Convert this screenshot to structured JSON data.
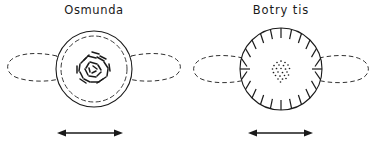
{
  "figure": {
    "background_color": "#ffffff",
    "ink_color": "#1a1a1a",
    "width": 375,
    "height": 142,
    "panel_count": 2
  },
  "panels": [
    {
      "key": "osmunda",
      "label": "Osmunda",
      "center_x": 94,
      "center_y": 69,
      "outline_style": "double-circle",
      "outer_circle_radius": 38,
      "inner_circle_radius": 33,
      "inner_circle_dash": "dashed",
      "center_pattern": "short-dash-rosette",
      "center_pattern_count": 26,
      "lobes": [
        "left-dashed-lobe",
        "right-dashed-lobe"
      ],
      "lobe_style": "dashed",
      "has_radial_ticks": false,
      "scale_bar": {
        "name": "double-headed-arrow",
        "x_start": 57,
        "x_end": 123,
        "y": 133
      }
    },
    {
      "key": "botrytis",
      "label": "Botry tis",
      "center_x": 282,
      "center_y": 69,
      "outline_style": "single-circle",
      "outer_circle_radius": 41,
      "inner_circle_radius": 0,
      "inner_circle_dash": "none",
      "center_pattern": "dot-stipple",
      "center_pattern_count": 24,
      "lobes": [
        "left-dashed-lobe",
        "right-dashed-lobe"
      ],
      "lobe_style": "dashed",
      "has_radial_ticks": true,
      "radial_tick_count": 24,
      "scale_bar": {
        "name": "double-headed-arrow",
        "x_start": 248,
        "x_end": 313,
        "y": 133
      }
    }
  ]
}
